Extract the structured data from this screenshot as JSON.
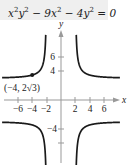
{
  "chart_data": {
    "type": "line",
    "equation": "x^2y^2 - 9x^2 - 4y^2 = 0",
    "equation_parts": {
      "t1": "x",
      "t1e": "2",
      "t2": "y",
      "t2e": "2",
      "t3": " − 9x",
      "t3e": "2",
      "t4": " − 4y",
      "t4e": "2",
      "t5": " = 0"
    },
    "xlabel": "x",
    "ylabel": "y",
    "x_ticks": [
      -6,
      -4,
      -2,
      2,
      4,
      6
    ],
    "x_tick_labels": [
      "−6",
      "−4",
      "−2",
      "2",
      "4",
      "6"
    ],
    "y_ticks": [
      -6,
      -4,
      4,
      6
    ],
    "y_tick_labels": [
      "",
      "−4",
      "4",
      "6"
    ],
    "xlim": [
      -8.4,
      9
    ],
    "ylim": [
      -9,
      12.5
    ],
    "grid": false,
    "asymptotes": {
      "vertical": [
        -2,
        2
      ],
      "horizontal": [
        -3,
        3
      ]
    },
    "series": [
      {
        "name": "upper-left branch",
        "function": "y = 3|x|/sqrt(x^2-4)",
        "domain": [
          -8,
          -2.05
        ]
      },
      {
        "name": "upper-right branch",
        "function": "y = 3|x|/sqrt(x^2-4)",
        "domain": [
          2.05,
          8
        ]
      },
      {
        "name": "lower-left branch",
        "function": "y = -3|x|/sqrt(x^2-4)",
        "domain": [
          -8,
          -2.05
        ]
      },
      {
        "name": "lower-right branch",
        "function": "y = -3|x|/sqrt(x^2-4)",
        "domain": [
          2.05,
          8
        ]
      }
    ],
    "annotations": [
      {
        "point": [
          -4,
          3.4641
        ],
        "label": "(−4, 2√3)"
      }
    ]
  },
  "labels": {
    "point": "(−4, 2√3)",
    "x_axis": "x",
    "y_axis": "y",
    "x_ticks": [
      "−6",
      "−4",
      "−2",
      "2",
      "4",
      "6"
    ],
    "y_ticks": {
      "six": "6",
      "four": "4",
      "neg_four": "−4"
    }
  }
}
